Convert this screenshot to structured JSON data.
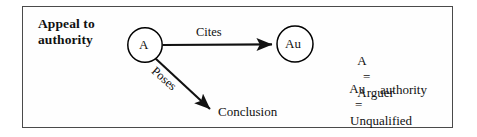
{
  "diagram": {
    "type": "argumentation-scheme-diagram",
    "scheme_label": "Appeal to\nauthority",
    "nodes": [
      {
        "id": "A",
        "label": "A",
        "shape": "circle",
        "cx": 145,
        "cy": 45,
        "r": 17
      },
      {
        "id": "Au",
        "label": "Au",
        "shape": "circle",
        "cx": 295,
        "cy": 44,
        "r": 18
      },
      {
        "id": "Conclusion",
        "label": "Conclusion",
        "shape": "text"
      }
    ],
    "edges": [
      {
        "from": "A",
        "to": "Au",
        "label": "Cites",
        "style": "solid-arrow",
        "direction": "horizontal"
      },
      {
        "from": "A",
        "to": "Conclusion",
        "label": "Poses",
        "style": "solid-arrow",
        "direction": "diagonal-down-right"
      }
    ],
    "legend": [
      {
        "symbol": "A",
        "equals": "=",
        "definition": "Arguer"
      },
      {
        "symbol": "Au",
        "equals": "=",
        "definition": "Unqualified",
        "definition_continued": "authority"
      }
    ],
    "colors": {
      "background": "#ffffff",
      "frame_border": "#4a4a4a",
      "ink": "#111111",
      "node_stroke": "#000000"
    }
  }
}
